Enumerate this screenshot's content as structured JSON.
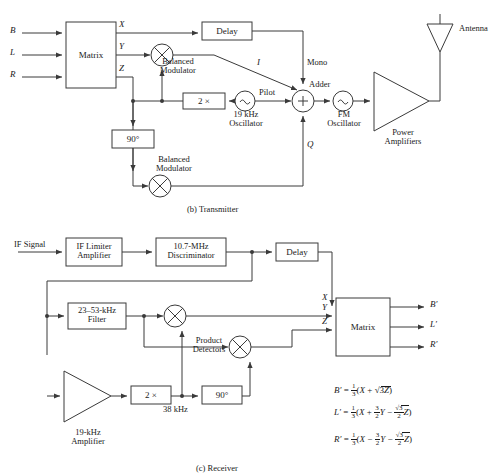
{
  "figure": {
    "transmitter_caption": "(b)  Transmitter",
    "receiver_caption": "(c)  Receiver"
  },
  "transmitter": {
    "inputs": [
      {
        "label": "B"
      },
      {
        "label": "L"
      },
      {
        "label": "R"
      }
    ],
    "matrix_label": "Matrix",
    "matrix_outputs": [
      {
        "label": "X"
      },
      {
        "label": "Y"
      },
      {
        "label": "Z"
      }
    ],
    "delay_label": "Delay",
    "balanced_modulator_upper": "Balanced\nModulator",
    "balanced_modulator_upper_l1": "Balanced",
    "balanced_modulator_upper_l2": "Modulator",
    "balanced_modulator_lower_l1": "Balanced",
    "balanced_modulator_lower_l2": "Modulator",
    "doubler_label": "2 ×",
    "phase_shift_label": "90°",
    "oscillator_19k_l1": "19 kHz",
    "oscillator_19k_l2": "Oscillator",
    "pilot_label": "Pilot",
    "adder_label": "Adder",
    "adder_symbol": "+",
    "mono_label": "Mono",
    "i_label": "I",
    "q_label": "Q",
    "fm_oscillator_l1": "FM",
    "fm_oscillator_l2": "Oscillator",
    "power_amplifiers_l1": "Power",
    "power_amplifiers_l2": "Amplifiers",
    "antenna_label": "Antenna"
  },
  "receiver": {
    "if_signal_label": "IF Signal",
    "if_limiter_l1": "IF Limiter",
    "if_limiter_l2": "Amplifier",
    "discriminator_l1": "10.7-MHz",
    "discriminator_l2": "Discriminator",
    "delay_label": "Delay",
    "filter_l1": "23–53-kHz",
    "filter_l2": "Filter",
    "product_detectors_l1": "Product",
    "product_detectors_l2": "Detectors",
    "amplifier_19k_l1": "19-kHz",
    "amplifier_19k_l2": "Amplifier",
    "doubler_label": "2 ×",
    "freq_38k_label": "38 kHz",
    "phase_shift_label": "90°",
    "matrix_label": "Matrix",
    "matrix_inputs": [
      {
        "label": "X"
      },
      {
        "label": "Y"
      },
      {
        "label": "Z"
      }
    ],
    "outputs": [
      {
        "label": "B′"
      },
      {
        "label": "L′"
      },
      {
        "label": "R′"
      }
    ],
    "equations": [
      {
        "lhs": "B′",
        "rhs_text": "B' = 1/3(X + √3 Z)"
      },
      {
        "lhs": "L′",
        "rhs_text": "L' = 1/3(X + 3/2 Y − (√3/2) Z)"
      },
      {
        "lhs": "R′",
        "rhs_text": "R' = 1/3(X − 3/2 Y − (√3/2) Z)"
      }
    ]
  },
  "colors": {
    "stroke": "#3a3a3a",
    "text": "#1a1a1a",
    "background": "#ffffff"
  }
}
